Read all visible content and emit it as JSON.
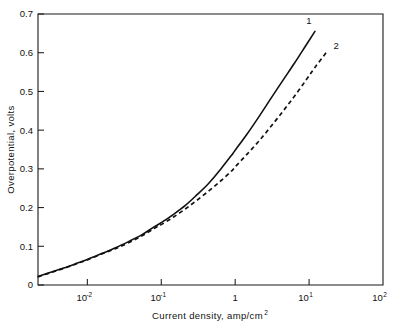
{
  "chart_data": {
    "type": "line",
    "title": "",
    "xlabel": "Current density, amp/cm",
    "xlabel_sup": "2",
    "ylabel": "Overpotential, volts",
    "xscale": "log",
    "yscale": "linear",
    "xlim": [
      0.00215,
      100
    ],
    "ylim": [
      0,
      0.7
    ],
    "grid": false,
    "legend_position": "inline-curve-labels",
    "x_ticks": [
      0.01,
      0.1,
      1,
      10,
      100
    ],
    "x_tick_labels": [
      "10⁻²",
      "10⁻¹",
      "1",
      "10¹",
      "10²"
    ],
    "x_tick_mantissa": [
      "10",
      "10",
      "1",
      "10",
      "10"
    ],
    "x_tick_exponent": [
      "-2",
      "-1",
      "",
      "1",
      "2"
    ],
    "y_ticks": [
      0,
      0.1,
      0.2,
      0.3,
      0.4,
      0.5,
      0.6,
      0.7
    ],
    "y_tick_labels": [
      "0",
      "0.1",
      "0.2",
      "0.3",
      "0.4",
      "0.5",
      "0.6",
      "0.7"
    ],
    "series": [
      {
        "name": "1",
        "label": "1",
        "style": "solid",
        "color": "#111111",
        "x": [
          0.00215,
          0.0032,
          0.0048,
          0.0072,
          0.01,
          0.016,
          0.024,
          0.036,
          0.055,
          0.08,
          0.1,
          0.145,
          0.21,
          0.3,
          0.44,
          0.63,
          0.9,
          1.0,
          1.45,
          2.1,
          3.0,
          4.4,
          6.3,
          9.0,
          12.0
        ],
        "y": [
          0.022,
          0.033,
          0.044,
          0.056,
          0.066,
          0.082,
          0.096,
          0.112,
          0.13,
          0.15,
          0.161,
          0.182,
          0.205,
          0.232,
          0.263,
          0.298,
          0.336,
          0.348,
          0.39,
          0.435,
          0.48,
          0.528,
          0.572,
          0.618,
          0.655
        ]
      },
      {
        "name": "2",
        "label": "2",
        "style": "dashed",
        "color": "#111111",
        "x": [
          0.00215,
          0.0032,
          0.0048,
          0.0072,
          0.01,
          0.016,
          0.024,
          0.036,
          0.055,
          0.08,
          0.1,
          0.145,
          0.21,
          0.3,
          0.44,
          0.63,
          0.9,
          1.0,
          1.45,
          2.1,
          3.0,
          4.4,
          6.3,
          9.0,
          12.0,
          17.0
        ],
        "y": [
          0.021,
          0.032,
          0.043,
          0.055,
          0.065,
          0.081,
          0.094,
          0.109,
          0.127,
          0.146,
          0.156,
          0.175,
          0.196,
          0.218,
          0.243,
          0.268,
          0.295,
          0.305,
          0.338,
          0.372,
          0.408,
          0.448,
          0.487,
          0.528,
          0.562,
          0.6
        ]
      }
    ]
  },
  "annotations": {
    "curve_1_label": "1",
    "curve_2_label": "2"
  },
  "colors": {
    "background": "#ffffff",
    "axis": "#1a1a1a",
    "series": "#111111"
  }
}
